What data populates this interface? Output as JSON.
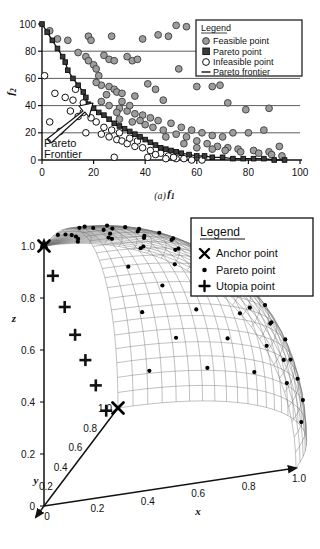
{
  "figure": {
    "panel_a_caption": "(a)",
    "panel_b_caption": "(b)"
  },
  "panel_a": {
    "legend_title": "Legend",
    "legend_items": [
      {
        "label": "Feasible point",
        "marker": "gray-filled-circle-icon",
        "color": "#9a9a9a"
      },
      {
        "label": "Pareto point",
        "marker": "dark-filled-square-icon",
        "color": "#3a3a3a"
      },
      {
        "label": "Infeasible point",
        "marker": "hollow-circle-icon",
        "color": "#ffffff"
      },
      {
        "label": "Pareto frontier",
        "marker": "line-segment-icon",
        "color": "#222222"
      }
    ],
    "annotation": {
      "line1": "Pareto",
      "line2": "Frontier"
    }
  },
  "panel_b": {
    "legend_title": "Legend",
    "legend_items": [
      {
        "label": "Anchor point",
        "marker": "x-cross-icon",
        "color": "#000000"
      },
      {
        "label": "Pareto point",
        "marker": "small-dot-icon",
        "color": "#000000"
      },
      {
        "label": "Utopia point",
        "marker": "plus-icon",
        "color": "#000000"
      }
    ]
  },
  "chart_data": [
    {
      "type": "scatter",
      "id": "pareto-frontier-2d",
      "title": "",
      "xlabel": "f1",
      "ylabel": "f2",
      "xlim": [
        0,
        100
      ],
      "ylim": [
        0,
        100
      ],
      "xticks": [
        0,
        20,
        40,
        60,
        80,
        100
      ],
      "yticks": [
        0,
        20,
        40,
        60,
        80,
        100
      ],
      "grid": "horizontal-gridlines-at-20-40-60-80",
      "legend_position": "top-right-inside",
      "series": [
        {
          "name": "Pareto frontier",
          "marker": "dark-square",
          "points": [
            [
              0,
              100
            ],
            [
              2,
              94
            ],
            [
              4,
              88
            ],
            [
              6,
              82
            ],
            [
              8,
              76
            ],
            [
              9,
              72
            ],
            [
              10,
              66
            ],
            [
              12,
              60
            ],
            [
              14,
              55
            ],
            [
              16,
              50
            ],
            [
              17,
              46
            ],
            [
              18,
              41
            ],
            [
              20,
              38
            ],
            [
              22,
              35
            ],
            [
              24,
              33
            ],
            [
              26,
              30
            ],
            [
              28,
              27
            ],
            [
              30,
              25
            ],
            [
              32,
              23
            ],
            [
              34,
              21
            ],
            [
              36,
              19
            ],
            [
              38,
              17
            ],
            [
              40,
              15
            ],
            [
              42,
              13
            ],
            [
              44,
              11
            ],
            [
              46,
              9
            ],
            [
              48,
              8
            ],
            [
              50,
              7
            ],
            [
              52,
              6
            ],
            [
              54,
              5
            ],
            [
              57,
              4
            ],
            [
              60,
              3
            ],
            [
              63,
              3
            ],
            [
              66,
              2
            ],
            [
              70,
              2
            ],
            [
              74,
              1
            ],
            [
              78,
              1
            ],
            [
              82,
              1
            ],
            [
              86,
              1
            ],
            [
              90,
              0
            ],
            [
              94,
              0
            ]
          ]
        },
        {
          "name": "Feasible point",
          "marker": "gray-circle",
          "points": [
            [
              3,
              95
            ],
            [
              6,
              89
            ],
            [
              10,
              88
            ],
            [
              18,
              91
            ],
            [
              19,
              88
            ],
            [
              27,
              91
            ],
            [
              39,
              89
            ],
            [
              45,
              92
            ],
            [
              49,
              91
            ],
            [
              52,
              99
            ],
            [
              56,
              98
            ],
            [
              95,
              88
            ],
            [
              14,
              79
            ],
            [
              17,
              76
            ],
            [
              18,
              73
            ],
            [
              20,
              70
            ],
            [
              21,
              67
            ],
            [
              24,
              77
            ],
            [
              26,
              74
            ],
            [
              28,
              73
            ],
            [
              33,
              76
            ],
            [
              35,
              73
            ],
            [
              37,
              74
            ],
            [
              53,
              67
            ],
            [
              22,
              62
            ],
            [
              23,
              55
            ],
            [
              26,
              54
            ],
            [
              28,
              52
            ],
            [
              29,
              50
            ],
            [
              31,
              49
            ],
            [
              36,
              47
            ],
            [
              41,
              56
            ],
            [
              44,
              52
            ],
            [
              47,
              44
            ],
            [
              60,
              54
            ],
            [
              66,
              54
            ],
            [
              69,
              55
            ],
            [
              72,
              42
            ],
            [
              79,
              37
            ],
            [
              88,
              38
            ],
            [
              23,
              43
            ],
            [
              26,
              40
            ],
            [
              30,
              38
            ],
            [
              33,
              36
            ],
            [
              36,
              34
            ],
            [
              39,
              33
            ],
            [
              42,
              31
            ],
            [
              45,
              29
            ],
            [
              50,
              27
            ],
            [
              54,
              24
            ],
            [
              58,
              22
            ],
            [
              62,
              20
            ],
            [
              66,
              18
            ],
            [
              70,
              17
            ],
            [
              74,
              20
            ],
            [
              80,
              20
            ],
            [
              86,
              22
            ],
            [
              30,
              30
            ],
            [
              35,
              28
            ],
            [
              40,
              26
            ],
            [
              47,
              22
            ],
            [
              52,
              19
            ],
            [
              56,
              17
            ],
            [
              60,
              14
            ],
            [
              64,
              12
            ],
            [
              68,
              10
            ],
            [
              72,
              9
            ],
            [
              76,
              8
            ],
            [
              82,
              7
            ],
            [
              88,
              6
            ],
            [
              92,
              10
            ],
            [
              55,
              12
            ],
            [
              60,
              9
            ],
            [
              66,
              8
            ],
            [
              71,
              7
            ],
            [
              77,
              6
            ],
            [
              84,
              5
            ],
            [
              89,
              4
            ],
            [
              93,
              3
            ],
            [
              43,
              24
            ],
            [
              48,
              17
            ],
            [
              38,
              29
            ],
            [
              29,
              35
            ],
            [
              25,
              48
            ],
            [
              21,
              57
            ],
            [
              31,
              43
            ],
            [
              34,
              40
            ]
          ]
        },
        {
          "name": "Infeasible point",
          "marker": "hollow-circle",
          "points": [
            [
              1,
              62
            ],
            [
              5,
              49
            ],
            [
              9,
              46
            ],
            [
              12,
              44
            ],
            [
              11,
              36
            ],
            [
              14,
              32
            ],
            [
              16,
              35
            ],
            [
              19,
              31
            ],
            [
              21,
              28
            ],
            [
              3,
              28
            ],
            [
              7,
              21
            ],
            [
              17,
              20
            ],
            [
              23,
              19
            ],
            [
              26,
              17
            ],
            [
              29,
              15
            ],
            [
              31,
              14
            ],
            [
              33,
              12
            ],
            [
              36,
              10
            ],
            [
              39,
              9
            ],
            [
              42,
              7
            ],
            [
              46,
              5
            ],
            [
              49,
              3
            ],
            [
              52,
              1
            ],
            [
              55,
              1
            ],
            [
              28,
              2
            ],
            [
              41,
              2
            ],
            [
              48,
              1
            ],
            [
              13,
              52
            ],
            [
              16,
              42
            ],
            [
              24,
              24
            ],
            [
              27,
              22
            ],
            [
              30,
              20
            ],
            [
              34,
              16
            ],
            [
              37,
              14
            ],
            [
              44,
              4
            ],
            [
              51,
              2
            ],
            [
              58,
              0
            ],
            [
              62,
              0
            ]
          ]
        }
      ]
    },
    {
      "type": "scatter3d",
      "id": "pareto-surface-3d",
      "title": "",
      "xlabel": "x",
      "ylabel": "y",
      "zlabel": "z",
      "xlim": [
        0,
        1.0
      ],
      "ylim": [
        0,
        1.0
      ],
      "zlim": [
        0,
        1.0
      ],
      "xticks": [
        0,
        0.2,
        0.4,
        0.6,
        0.8,
        1.0
      ],
      "yticks": [
        0.2,
        0.4,
        0.6,
        0.8,
        1.0
      ],
      "zticks": [
        0,
        0.2,
        0.4,
        0.6,
        0.8,
        1.0
      ],
      "grid": "mesh-surface",
      "legend_position": "top-right-outside",
      "surface": "unit-sphere-octant-mesh",
      "series": [
        {
          "name": "Anchor point",
          "marker": "x-cross",
          "points": [
            [
              0,
              0,
              1.0
            ],
            [
              0,
              1.0,
              0
            ]
          ]
        },
        {
          "name": "Utopia point",
          "marker": "plus",
          "count": 6,
          "note": "arranged along the y-z plane edge"
        },
        {
          "name": "Pareto point",
          "marker": "dot",
          "count": 96,
          "note": "distributed across the spherical surface"
        }
      ]
    }
  ]
}
